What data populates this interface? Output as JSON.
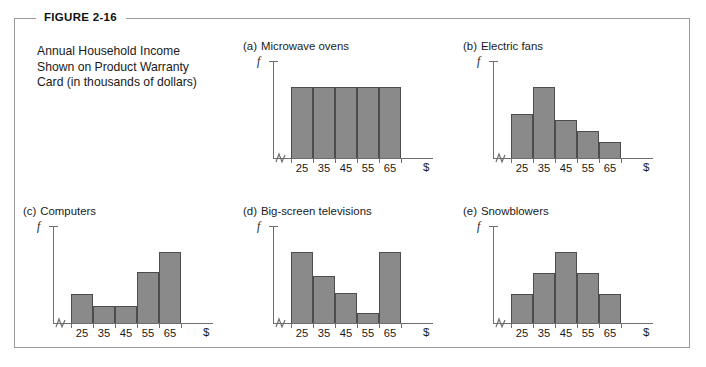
{
  "figure": {
    "tag": "FIGURE 2-16",
    "caption_lines": [
      "Annual Household Income",
      "Shown on Product Warranty",
      "Card (in thousands of dollars)"
    ]
  },
  "axis": {
    "y_label": "f",
    "x_unit_label": "$",
    "tick_labels": [
      "25",
      "35",
      "45",
      "55",
      "65"
    ]
  },
  "colors": {
    "bar_fill": "#8a8a8a",
    "bar_stroke": "#4d4d4d",
    "axis": "#6e6e6e",
    "frame": "#9a9a9a",
    "text": "#1a1a1a"
  },
  "panels": [
    {
      "index": "(a)",
      "title": "Microwave ovens"
    },
    {
      "index": "(b)",
      "title": "Electric fans"
    },
    {
      "index": "(c)",
      "title": "Computers"
    },
    {
      "index": "(d)",
      "title": "Big-screen televisions"
    },
    {
      "index": "(e)",
      "title": "Snowblowers"
    }
  ],
  "chart_data": [
    {
      "type": "bar",
      "title": "(a) Microwave ovens",
      "categories": [
        "25",
        "35",
        "45",
        "55",
        "65"
      ],
      "values": [
        1.0,
        1.0,
        1.0,
        1.0,
        1.0
      ],
      "shape": "uniform",
      "xlabel": "$",
      "ylabel": "f",
      "ylim": [
        0,
        1.15
      ],
      "grid": false,
      "axis_break": true
    },
    {
      "type": "bar",
      "title": "(b) Electric fans",
      "categories": [
        "25",
        "35",
        "45",
        "55",
        "65"
      ],
      "values": [
        0.62,
        1.0,
        0.53,
        0.38,
        0.22
      ],
      "shape": "skewed-right",
      "xlabel": "$",
      "ylabel": "f",
      "ylim": [
        0,
        1.15
      ],
      "grid": false,
      "axis_break": true
    },
    {
      "type": "bar",
      "title": "(c) Computers",
      "categories": [
        "25",
        "35",
        "45",
        "55",
        "65"
      ],
      "values": [
        0.4,
        0.24,
        0.24,
        0.72,
        1.0
      ],
      "shape": "skewed-left",
      "xlabel": "$",
      "ylabel": "f",
      "ylim": [
        0,
        1.15
      ],
      "grid": false,
      "axis_break": true
    },
    {
      "type": "bar",
      "title": "(d) Big-screen televisions",
      "categories": [
        "25",
        "35",
        "45",
        "55",
        "65"
      ],
      "values": [
        1.0,
        0.66,
        0.42,
        0.14,
        1.0
      ],
      "shape": "bimodal-u",
      "xlabel": "$",
      "ylabel": "f",
      "ylim": [
        0,
        1.15
      ],
      "grid": false,
      "axis_break": true
    },
    {
      "type": "bar",
      "title": "(e) Snowblowers",
      "categories": [
        "25",
        "35",
        "45",
        "55",
        "65"
      ],
      "values": [
        0.4,
        0.7,
        1.0,
        0.7,
        0.4
      ],
      "shape": "symmetric-bell",
      "xlabel": "$",
      "ylabel": "f",
      "ylim": [
        0,
        1.15
      ],
      "grid": false,
      "axis_break": true
    }
  ]
}
